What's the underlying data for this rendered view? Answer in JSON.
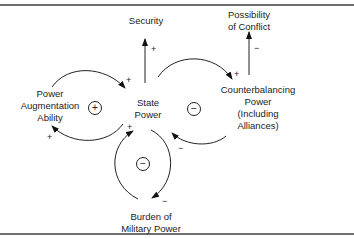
{
  "diagram": {
    "title": "",
    "nodes": {
      "security": "Security",
      "possibility_of_conflict": "Possibility\nof Conflict",
      "power_augmentation_ability": "Power\nAugmentation\nAbility",
      "state_power": "State\nPower",
      "counterbalancing_power": "Counterbalancing\nPower\n(Including\nAlliances)",
      "burden_of_military_power": "Burden of\nMilitary Power"
    },
    "loops": {
      "augmentation": "+",
      "counterbalancing": "−",
      "burden": "−"
    },
    "edges": [
      {
        "from": "State Power",
        "to": "Security",
        "sign": "+"
      },
      {
        "from": "Counterbalancing Power",
        "to": "Possibility of Conflict",
        "sign": "−"
      },
      {
        "from": "Power Augmentation Ability",
        "to": "State Power",
        "sign": "+"
      },
      {
        "from": "State Power",
        "to": "Power Augmentation Ability",
        "sign": "+"
      },
      {
        "from": "State Power",
        "to": "Counterbalancing Power",
        "sign": "+"
      },
      {
        "from": "Counterbalancing Power",
        "to": "State Power",
        "sign": "−"
      },
      {
        "from": "State Power",
        "to": "Burden of Military Power",
        "sign": "−"
      },
      {
        "from": "Burden of Military Power",
        "to": "State Power",
        "sign": "+"
      }
    ],
    "edge_signs": {
      "sp_security": "+",
      "cp_conflict": "−",
      "paa_sp": "+",
      "sp_paa": "+",
      "sp_cp": "+",
      "cp_sp": "−",
      "sp_burden": "−",
      "burden_sp": "+"
    }
  }
}
